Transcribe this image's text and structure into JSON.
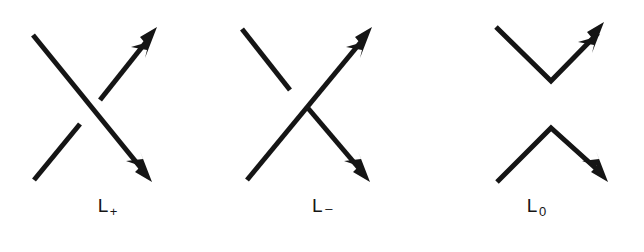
{
  "figure": {
    "background_color": "#ffffff",
    "ink_color": "#151515",
    "stroke_width": 5,
    "width": 644,
    "height": 252
  },
  "panels": [
    {
      "id": "L-plus",
      "label_base": "L",
      "label_sub": "+",
      "label_full": "L+",
      "crossing_type": "positive",
      "description": "positive crossing: strand from upper-left to lower-right passes over",
      "strands": [
        {
          "name": "over-strand",
          "over": true,
          "direction": "northwest-to-southeast",
          "arrow_at": "southeast",
          "start": [
            33,
            35
          ],
          "end": [
            152,
            182
          ]
        },
        {
          "name": "under-strand",
          "over": false,
          "direction": "southwest-to-northeast",
          "arrow_at": "northeast",
          "start": [
            34,
            180
          ],
          "break_in": [
            80,
            124
          ],
          "break_out": [
            100,
            100
          ],
          "end": [
            157,
            27
          ]
        }
      ]
    },
    {
      "id": "L-minus",
      "label_base": "L",
      "label_sub": "–",
      "label_full": "L−",
      "crossing_type": "negative",
      "description": "negative crossing: strand from lower-left to upper-right passes over",
      "strands": [
        {
          "name": "over-strand",
          "over": true,
          "direction": "southwest-to-northeast",
          "arrow_at": "northeast",
          "start": [
            32,
            180
          ],
          "end": [
            157,
            27
          ]
        },
        {
          "name": "under-strand",
          "over": false,
          "direction": "northwest-to-southeast",
          "arrow_at": "southeast",
          "start": [
            27,
            29
          ],
          "break_in": [
            75,
            90
          ],
          "break_out": [
            92,
            107
          ],
          "end": [
            155,
            182
          ]
        }
      ]
    },
    {
      "id": "L-zero",
      "label_base": "L",
      "label_sub": "0",
      "label_full": "L0",
      "crossing_type": "smoothed",
      "description": "oriented smoothing: upper V opening upward, lower V opening downward, no crossing",
      "strands": [
        {
          "name": "upper-arc",
          "over": null,
          "direction": "northwest-to-northeast via lower vertex",
          "arrow_at": "northeast",
          "start": [
            67,
            27
          ],
          "vertex": [
            122,
            81
          ],
          "end": [
            175,
            22
          ]
        },
        {
          "name": "lower-arc",
          "over": null,
          "direction": "southwest-to-southeast via upper vertex",
          "arrow_at": "southeast",
          "start": [
            68,
            182
          ],
          "vertex": [
            122,
            128
          ],
          "end": [
            179,
            182
          ]
        }
      ]
    }
  ]
}
